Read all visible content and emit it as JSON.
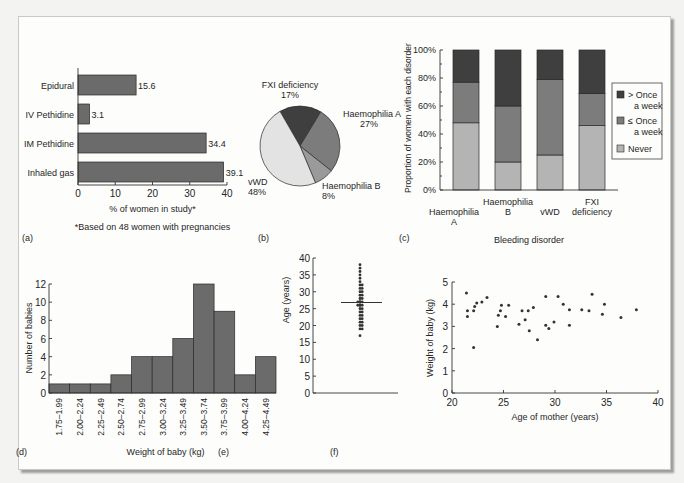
{
  "colors": {
    "bar": "#6b6b6b",
    "dark": "#3f3f3f",
    "mid": "#7c7c7c",
    "light": "#b4b4b4",
    "lighter": "#9a9a9a",
    "lightest": "#e3e3e3",
    "axis": "#333333",
    "text": "#262626"
  },
  "panels": {
    "a": {
      "label": "(a)"
    },
    "b": {
      "label": "(b)"
    },
    "c": {
      "label": "(c)"
    },
    "d": {
      "label": "(d)"
    },
    "e": {
      "label": "(e)"
    },
    "f": {
      "label": "(f)"
    }
  },
  "chart_data": [
    {
      "id": "a",
      "type": "bar",
      "orientation": "horizontal",
      "title": "",
      "categories": [
        "Epidural",
        "IV Pethidine",
        "IM Pethidine",
        "Inhaled gas"
      ],
      "values": [
        15.6,
        3.1,
        34.4,
        39.1
      ],
      "value_labels": [
        "15.6",
        "3.1",
        "34.4",
        "39.1"
      ],
      "xlabel": "% of women in study*",
      "ylabel": "",
      "xlim": [
        0,
        40
      ],
      "xticks": [
        0,
        10,
        20,
        30,
        40
      ],
      "footnote": "*Based on 48 women with pregnancies",
      "grid": false
    },
    {
      "id": "b",
      "type": "pie",
      "title": "",
      "slices": [
        {
          "label": "FXI deficiency",
          "pct_label": "17%",
          "value": 17,
          "shade": "dark"
        },
        {
          "label": "Haemophilia A",
          "pct_label": "27%",
          "value": 27,
          "shade": "mid"
        },
        {
          "label": "Haemophilia B",
          "pct_label": "8%",
          "value": 8,
          "shade": "lighter"
        },
        {
          "label": "vWD",
          "pct_label": "48%",
          "value": 48,
          "shade": "lightest"
        }
      ],
      "start_angle_deg": -30
    },
    {
      "id": "c",
      "type": "bar",
      "stacked": true,
      "title": "",
      "categories": [
        "Haemophilia A",
        "Haemophilia B",
        "vWD",
        "FXI deficiency"
      ],
      "category_lines": [
        [
          "Haemophilia",
          "A"
        ],
        [
          "Haemophilia",
          "B"
        ],
        [
          "vWD"
        ],
        [
          "FXI",
          "deficiency"
        ]
      ],
      "category_label_offset": [
        1,
        0,
        1,
        0
      ],
      "series": [
        {
          "name": "Never",
          "values": [
            48,
            20,
            25,
            46
          ],
          "shade": "light"
        },
        {
          "name": "≤ Once a week",
          "values": [
            29,
            40,
            54,
            23
          ],
          "shade": "mid"
        },
        {
          "name": "> Once a week",
          "values": [
            23,
            40,
            21,
            31
          ],
          "shade": "dark"
        }
      ],
      "legend": [
        {
          "lines": [
            "> Once",
            "a week"
          ],
          "shade": "dark"
        },
        {
          "lines": [
            "≤ Once",
            "a week"
          ],
          "shade": "mid"
        },
        {
          "lines": [
            "Never"
          ],
          "shade": "light"
        }
      ],
      "legend_position": "right",
      "xlabel": "Bleeding disorder",
      "ylabel": "Proportion of women with each disorder",
      "ylim": [
        0,
        100
      ],
      "yticks": [
        "0%",
        "20%",
        "40%",
        "60%",
        "80%",
        "100%"
      ],
      "grid": false
    },
    {
      "id": "d",
      "type": "bar",
      "subtype": "histogram",
      "title": "",
      "categories": [
        "1.75–1.99",
        "2.00–2.24",
        "2.25–2.49",
        "2.50–2.74",
        "2.75–2.99",
        "3.00–3.24",
        "3.25–3.49",
        "3.50–3.74",
        "3.75–3.99",
        "4.00–4.24",
        "4.25–4.49"
      ],
      "values": [
        1,
        1,
        1,
        2,
        4,
        4,
        6,
        12,
        9,
        2,
        4
      ],
      "xlabel": "Weight of baby (kg)",
      "ylabel": "Number of babies",
      "ylim": [
        0,
        12
      ],
      "yticks": [
        0,
        2,
        4,
        6,
        8,
        10,
        12
      ],
      "grid": false
    },
    {
      "id": "e",
      "type": "scatter",
      "subtype": "dot-plot",
      "title": "",
      "ylabel": "Age (years)",
      "xlabel": "",
      "ylim": [
        0,
        40
      ],
      "yticks": [
        0,
        5,
        10,
        15,
        20,
        25,
        30,
        35,
        40
      ],
      "mean": 26.8,
      "values": [
        17,
        19,
        19,
        20,
        20,
        21,
        21,
        22,
        22,
        23,
        23,
        24,
        24,
        25,
        25,
        26,
        26,
        26,
        27,
        27,
        27,
        28,
        28,
        29,
        29,
        30,
        30,
        31,
        31,
        32,
        32,
        33,
        34,
        35,
        36,
        37,
        38
      ]
    },
    {
      "id": "f",
      "type": "scatter",
      "title": "",
      "xlabel": "Age of mother (years)",
      "ylabel": "Weight of baby (kg)",
      "xlim": [
        20,
        40
      ],
      "ylim": [
        0,
        5
      ],
      "xticks": [
        20,
        25,
        30,
        35,
        40
      ],
      "yticks": [
        0,
        1,
        2,
        3,
        4,
        5
      ],
      "points": [
        [
          21.4,
          4.5
        ],
        [
          21.5,
          3.7
        ],
        [
          21.5,
          3.45
        ],
        [
          22.1,
          2.05
        ],
        [
          22.1,
          3.7
        ],
        [
          22.2,
          3.9
        ],
        [
          22.4,
          4.05
        ],
        [
          22.9,
          4.1
        ],
        [
          23.4,
          4.3
        ],
        [
          24.4,
          3.0
        ],
        [
          24.5,
          3.5
        ],
        [
          24.7,
          3.7
        ],
        [
          24.8,
          3.95
        ],
        [
          25.2,
          3.45
        ],
        [
          25.5,
          3.95
        ],
        [
          26.5,
          3.1
        ],
        [
          26.8,
          3.7
        ],
        [
          27.1,
          3.3
        ],
        [
          27.4,
          3.7
        ],
        [
          27.5,
          2.8
        ],
        [
          27.9,
          3.85
        ],
        [
          28.3,
          2.4
        ],
        [
          29.1,
          4.35
        ],
        [
          29.1,
          3.05
        ],
        [
          29.4,
          2.9
        ],
        [
          29.9,
          3.2
        ],
        [
          30.3,
          4.35
        ],
        [
          30.8,
          4.0
        ],
        [
          31.4,
          3.75
        ],
        [
          31.4,
          3.05
        ],
        [
          32.6,
          3.75
        ],
        [
          33.3,
          3.7
        ],
        [
          33.6,
          4.45
        ],
        [
          34.6,
          3.55
        ],
        [
          34.8,
          4.0
        ],
        [
          36.4,
          3.4
        ],
        [
          37.9,
          3.75
        ]
      ],
      "grid": false
    }
  ]
}
